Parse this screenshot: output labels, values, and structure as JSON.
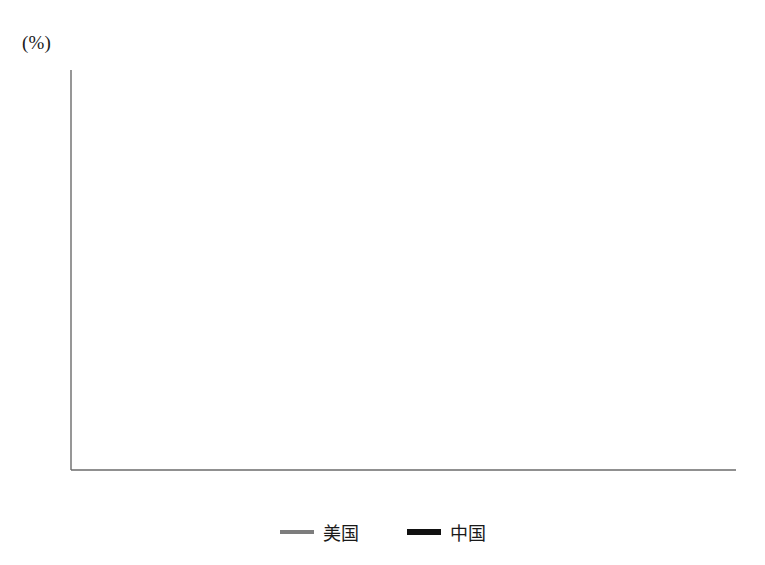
{
  "axis": {
    "unit_label": "(%)",
    "y_ticks": [
      "0",
      "10",
      "20",
      "30",
      "40",
      "50",
      "60"
    ],
    "x_ticks_labeled": [
      "2000",
      "2003",
      "2006",
      "2009",
      "2012",
      "2015"
    ]
  },
  "legend": {
    "items": [
      {
        "label": "美国",
        "color": "#7d7d7d",
        "icon": "line-swatch-icon"
      },
      {
        "label": "中国",
        "color": "#111111",
        "icon": "line-swatch-icon"
      }
    ]
  },
  "chart_data": {
    "type": "line",
    "title": "",
    "xlabel": "",
    "ylabel": "(%)",
    "ylim": [
      0,
      60
    ],
    "xlim": [
      2000,
      2015
    ],
    "ytick_step": 10,
    "grid": "horizontal",
    "legend_position": "bottom-center",
    "x": [
      2000,
      2001,
      2002,
      2003,
      2004,
      2005,
      2006,
      2007,
      2008,
      2009,
      2010,
      2011,
      2012,
      2013,
      2014,
      2015
    ],
    "series": [
      {
        "name": "美国",
        "color": "#7d7d7d",
        "line_width": 3,
        "values": [
          20.5,
          19.3,
          18.0,
          17.2,
          17.6,
          18.9,
          17.3,
          15.9,
          14.9,
          14.3,
          15.3,
          16.2,
          17.3,
          17.8,
          17.7,
          17.7
        ]
      },
      {
        "name": "中国",
        "color": "#111111",
        "line_width": 5,
        "values": [
          37.0,
          37.8,
          40.0,
          43.6,
          46.4,
          47.2,
          49.9,
          51.4,
          53.1,
          51.8,
          52.0,
          50.2,
          50.1,
          49.6,
          48.9,
          48.2
        ]
      }
    ]
  }
}
